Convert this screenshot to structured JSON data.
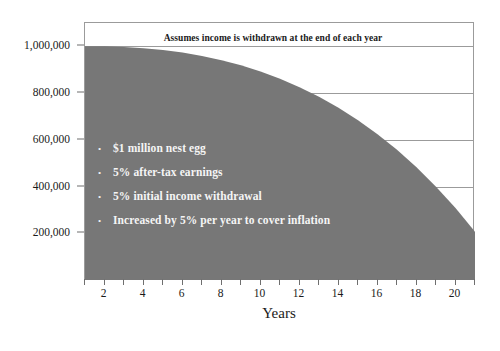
{
  "chart_data": {
    "type": "area",
    "title": "",
    "annotation": "Assumes income is withdrawn at the end of each year",
    "xlabel": "Years",
    "ylabel": "",
    "xlim": [
      1,
      21
    ],
    "ylim": [
      0,
      1100000
    ],
    "grid": true,
    "legend_position": "none",
    "series_color": "#777777",
    "x": [
      1,
      2,
      3,
      4,
      5,
      6,
      7,
      8,
      9,
      10,
      11,
      12,
      13,
      14,
      15,
      16,
      17,
      18,
      19,
      20,
      21
    ],
    "series": [
      {
        "name": "Nest egg balance",
        "values": [
          1000000,
          1000000,
          997500,
          992375,
          984392,
          973304,
          958847,
          940739,
          918681,
          892352,
          861413,
          825502,
          784235,
          737203,
          683975,
          624090,
          557062,
          482376,
          399485,
          307812,
          206742
        ]
      }
    ],
    "y_ticks": [
      200000,
      400000,
      600000,
      800000,
      1000000
    ],
    "y_tick_labels": [
      "200,000",
      "400,000",
      "600,000",
      "800,000",
      "1,000,000"
    ],
    "x_ticks": [
      1,
      2,
      3,
      4,
      5,
      6,
      7,
      8,
      9,
      10,
      11,
      12,
      13,
      14,
      15,
      16,
      17,
      18,
      19,
      20,
      21
    ],
    "x_tick_labels": {
      "2": "2",
      "4": "4",
      "6": "6",
      "8": "8",
      "10": "10",
      "12": "12",
      "14": "14",
      "16": "16",
      "18": "18",
      "20": "20"
    }
  },
  "callouts": {
    "bullet_glyph": "•",
    "items": [
      "$1 million nest egg",
      "5% after-tax earnings",
      "5% initial income withdrawal",
      "Increased by 5% per year to cover inflation"
    ]
  }
}
